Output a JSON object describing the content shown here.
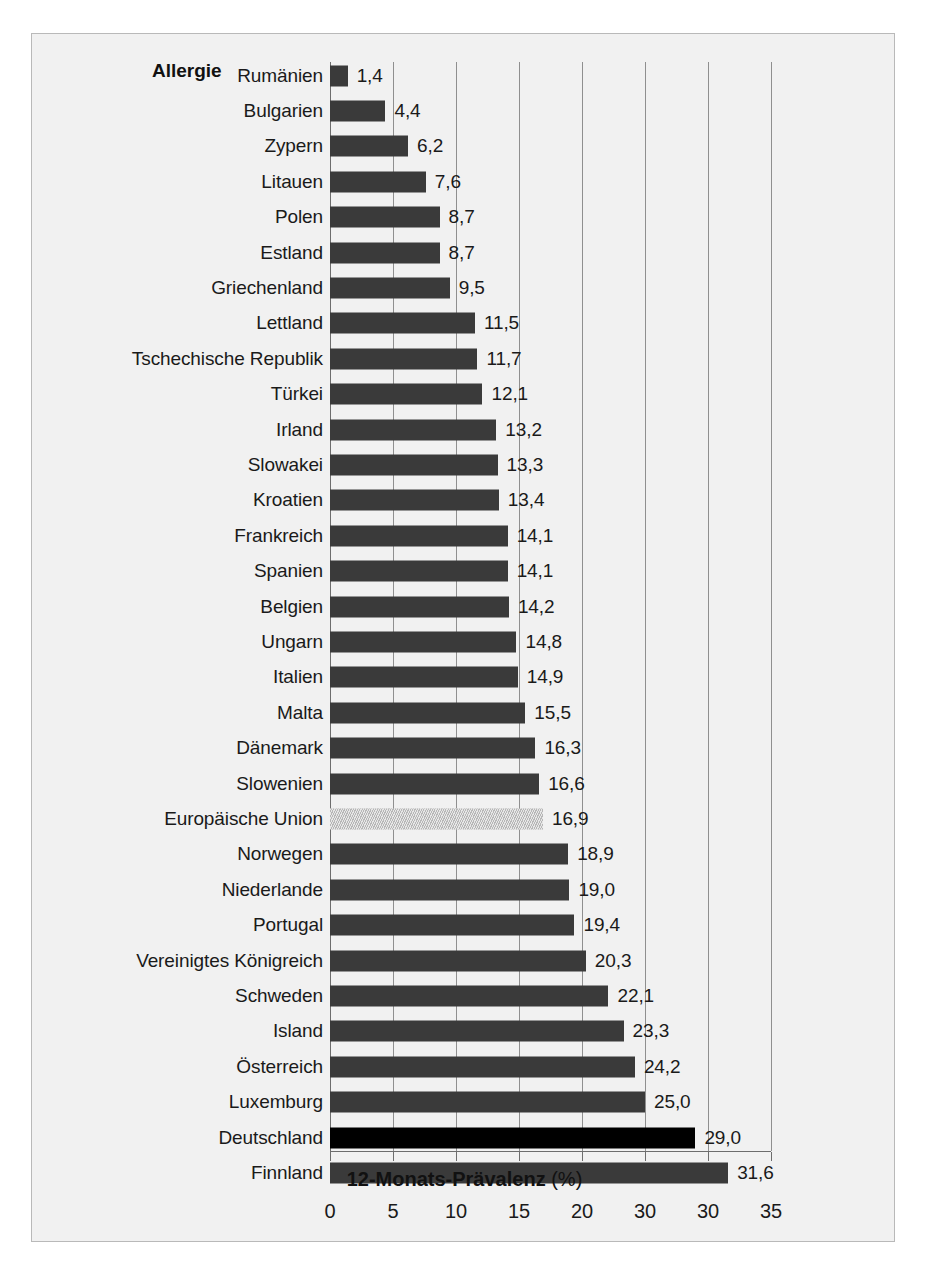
{
  "figure": {
    "series_name": "Allergie",
    "axis_title_main": "12-Monats-Prävalenz",
    "axis_title_unit": "(%)"
  },
  "chart_data": {
    "type": "bar",
    "orientation": "horizontal",
    "title": "Allergie",
    "xlabel": "12-Monats-Prävalenz (%)",
    "ylabel": "",
    "xlim": [
      0,
      35
    ],
    "grid": true,
    "legend": "none",
    "tick_labels": [
      "0",
      "5",
      "10",
      "15",
      "20",
      "30",
      "30",
      "35"
    ],
    "tick_values": [
      0,
      5,
      10,
      15,
      20,
      25,
      30,
      35
    ],
    "categories": [
      "Rumänien",
      "Bulgarien",
      "Zypern",
      "Litauen",
      "Polen",
      "Estland",
      "Griechenland",
      "Lettland",
      "Tschechische Republik",
      "Türkei",
      "Irland",
      "Slowakei",
      "Kroatien",
      "Frankreich",
      "Spanien",
      "Belgien",
      "Ungarn",
      "Italien",
      "Malta",
      "Dänemark",
      "Slowenien",
      "Europäische Union",
      "Norwegen",
      "Niederlande",
      "Portugal",
      "Vereinigtes Königreich",
      "Schweden",
      "Island",
      "Österreich",
      "Luxemburg",
      "Deutschland",
      "Finnland"
    ],
    "values": [
      1.4,
      4.4,
      6.2,
      7.6,
      8.7,
      8.7,
      9.5,
      11.5,
      11.7,
      12.1,
      13.2,
      13.3,
      13.4,
      14.1,
      14.1,
      14.2,
      14.8,
      14.9,
      15.5,
      16.3,
      16.6,
      16.9,
      18.9,
      19.0,
      19.4,
      20.3,
      22.1,
      23.3,
      24.2,
      25.0,
      29.0,
      31.6
    ],
    "value_labels": [
      "1,4",
      "4,4",
      "6,2",
      "7,6",
      "8,7",
      "8,7",
      "9,5",
      "11,5",
      "11,7",
      "12,1",
      "13,2",
      "13,3",
      "13,4",
      "14,1",
      "14,1",
      "14,2",
      "14,8",
      "14,9",
      "15,5",
      "16,3",
      "16,6",
      "16,9",
      "18,9",
      "19,0",
      "19,4",
      "20,3",
      "22,1",
      "23,3",
      "24,2",
      "25,0",
      "29,0",
      "31,6"
    ],
    "bar_styles": [
      "normal",
      "normal",
      "normal",
      "normal",
      "normal",
      "normal",
      "normal",
      "normal",
      "normal",
      "normal",
      "normal",
      "normal",
      "normal",
      "normal",
      "normal",
      "normal",
      "normal",
      "normal",
      "normal",
      "normal",
      "normal",
      "highlight-gray",
      "normal",
      "normal",
      "normal",
      "normal",
      "normal",
      "normal",
      "normal",
      "normal",
      "highlight-black",
      "normal"
    ],
    "colors": {
      "bar": "#3a3a3a",
      "bar_highlight_black": "#000000",
      "bar_highlight_gray": "#c9c9c9",
      "background": "#f1f1f1",
      "gridline": "#8f8f8f",
      "text": "#1a1a1a"
    }
  }
}
